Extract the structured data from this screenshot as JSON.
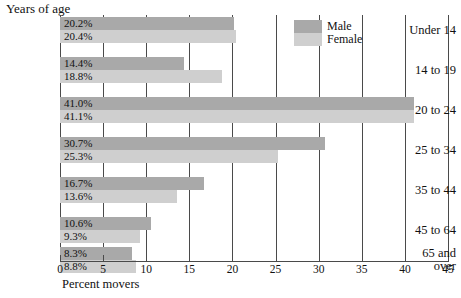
{
  "chart_data": {
    "type": "bar",
    "orientation": "horizontal",
    "title": "Years of age",
    "xlabel": "Percent movers",
    "ylabel": "Years of age",
    "xlim": [
      0,
      45
    ],
    "xticks": [
      0,
      5,
      10,
      15,
      20,
      25,
      30,
      35,
      40,
      45
    ],
    "xtick_labels": [
      "0",
      "5",
      "10",
      "15",
      "20",
      "25",
      "30",
      "35",
      "40",
      "45"
    ],
    "grid": "vertical",
    "legend_position": "top-right",
    "categories": [
      "Under 14",
      "14 to 19",
      "20 to 24",
      "25 to 34",
      "35 to 44",
      "45 to 64",
      "65 and over"
    ],
    "series": [
      {
        "name": "Male",
        "color": "#a9a9a9",
        "values": [
          20.2,
          14.4,
          41.0,
          30.7,
          16.7,
          10.6,
          8.3
        ],
        "labels": [
          "20.2%",
          "14.4%",
          "41.0%",
          "30.7%",
          "16.7%",
          "10.6%",
          "8.3%"
        ]
      },
      {
        "name": "Female",
        "color": "#cfcfcf",
        "values": [
          20.4,
          18.8,
          41.1,
          25.3,
          13.6,
          9.3,
          8.8
        ],
        "labels": [
          "20.4%",
          "18.8%",
          "41.1%",
          "25.3%",
          "13.6%",
          "9.3%",
          "8.8%"
        ]
      }
    ]
  },
  "categories_display": [
    {
      "lines": [
        "Under 14"
      ]
    },
    {
      "lines": [
        "14 to 19"
      ]
    },
    {
      "lines": [
        "20 to 24"
      ]
    },
    {
      "lines": [
        "25 to 34"
      ]
    },
    {
      "lines": [
        "35 to 44"
      ]
    },
    {
      "lines": [
        "45 to 64"
      ]
    },
    {
      "lines": [
        "65 and",
        "over"
      ]
    }
  ],
  "legend": {
    "items": [
      {
        "label": "Male",
        "color": "#a9a9a9"
      },
      {
        "label": "Female",
        "color": "#cfcfcf"
      }
    ]
  },
  "colors": {
    "male": "#a9a9a9",
    "female": "#cfcfcf",
    "axis": "#4a4a4a",
    "text": "#111111",
    "background": "#ffffff"
  }
}
